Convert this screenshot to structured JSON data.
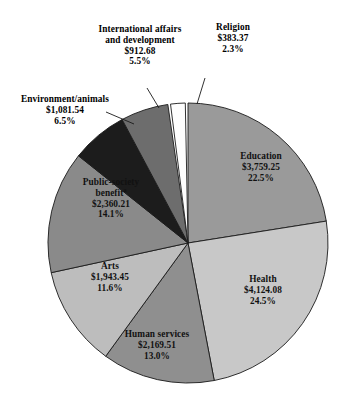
{
  "chart_data": {
    "type": "pie",
    "title": "",
    "subtitle": "",
    "xlabel": "",
    "ylabel": "",
    "grid": false,
    "legend": "none",
    "label_format": "name, amount (US$ billions), percent of total",
    "start_angle_deg": 0,
    "direction": "clockwise",
    "categories": [
      "Education",
      "Health",
      "Human services",
      "Arts",
      "Public-society benefit",
      "Environment/animals",
      "International affairs and development",
      "Religion"
    ],
    "values": [
      22.5,
      24.5,
      13.0,
      11.6,
      14.1,
      6.5,
      5.5,
      2.3
    ],
    "amounts": [
      3759.25,
      4124.08,
      2169.51,
      1943.45,
      2360.21,
      1081.54,
      912.68,
      383.37
    ],
    "slices": [
      {
        "key": "education",
        "name": "Education",
        "amount": "$3,759.25",
        "percent": "22.5%",
        "value": 22.5,
        "color": "#9a9a9a",
        "footnote": ""
      },
      {
        "key": "health",
        "name": "Health",
        "amount": "$4,124.08",
        "percent": "24.5%",
        "value": 24.5,
        "color": "#c8c8c8",
        "footnote": ""
      },
      {
        "key": "human-services",
        "name": "Human services",
        "amount": "$2,169.51",
        "percent": "13.0%",
        "value": 13.0,
        "color": "#8f8f8f",
        "footnote": ""
      },
      {
        "key": "arts",
        "name": "Arts",
        "amount": "$1,943.45",
        "percent": "11.6%",
        "value": 11.6,
        "color": "#bdbdbd",
        "footnote": ""
      },
      {
        "key": "public-society-benefit",
        "name": "Public-society benefit",
        "amount": "$2,360.21",
        "percent": "14.1%",
        "value": 14.1,
        "color": "#8a8a8a",
        "footnote": "a"
      },
      {
        "key": "environment-animals",
        "name": "Environment/animals",
        "amount": "$1,081.54",
        "percent": "6.5%",
        "value": 6.5,
        "color": "#1c1c1c",
        "footnote": ""
      },
      {
        "key": "international-affairs",
        "name": "International affairs and development",
        "name_line1": "International affairs",
        "name_line2": "and development",
        "amount": "$912.68",
        "percent": "5.5%",
        "value": 5.5,
        "color": "#6d6d6d",
        "footnote": ""
      },
      {
        "key": "religion",
        "name": "Religion",
        "amount": "$383.37",
        "percent": "2.3%",
        "value": 2.3,
        "color": "#fdfdfd",
        "footnote": ""
      }
    ],
    "colors": {
      "education": "#9a9a9a",
      "health": "#c8c8c8",
      "human_services": "#8f8f8f",
      "arts": "#bdbdbd",
      "public_society_benefit": "#8a8a8a",
      "environment_animals": "#1c1c1c",
      "international_affairs": "#6d6d6d",
      "religion": "#fdfdfd",
      "outline": "#1a1a1a",
      "background": "#ffffff",
      "text": "#0a0a0a"
    }
  }
}
